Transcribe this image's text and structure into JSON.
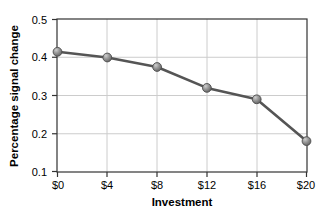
{
  "chart_data": {
    "type": "line",
    "title": "",
    "xlabel": "Investment",
    "ylabel": "Percentage signal change",
    "x": [
      0,
      4,
      8,
      12,
      16,
      20
    ],
    "categories": [
      "$0",
      "$4",
      "$8",
      "$12",
      "$16",
      "$20"
    ],
    "values": [
      0.415,
      0.4,
      0.375,
      0.32,
      0.29,
      0.18
    ],
    "series": [
      {
        "name": "Percentage signal change",
        "values": [
          0.415,
          0.4,
          0.375,
          0.32,
          0.29,
          0.18
        ]
      }
    ],
    "xtick_labels": [
      "$0",
      "$4",
      "$8",
      "$12",
      "$16",
      "$20"
    ],
    "ytick_labels": [
      "0.5",
      "0.4",
      "0.3",
      "0.2",
      "0.1"
    ],
    "yticks": [
      0.5,
      0.4,
      0.3,
      0.2,
      0.1
    ],
    "ylim": [
      0.1,
      0.5
    ],
    "xlim": [
      0,
      20
    ],
    "grid": "horizontal-and-vertical",
    "legend": "none",
    "marker": "circle-sphere",
    "colors": {
      "line": "#555555",
      "marker_fill": "#8c8c8c",
      "marker_edge": "#4d4d4d",
      "grid": "#cccccc",
      "axis": "#333333",
      "text": "#000000",
      "background": "#ffffff"
    }
  }
}
